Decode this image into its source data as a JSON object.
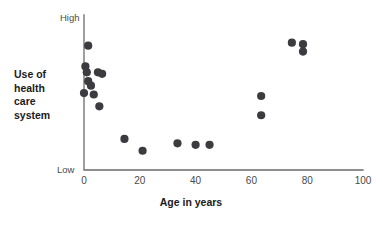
{
  "chart_data": {
    "type": "scatter",
    "title": "",
    "xlabel": "Age in years",
    "ylabel": "Use of health care system",
    "xlim": [
      0,
      100
    ],
    "ylim": [
      0,
      100
    ],
    "grid": false,
    "legend": null,
    "x_ticks": [
      "0",
      "20",
      "40",
      "60",
      "80",
      "100"
    ],
    "x_tick_values": [
      0,
      20,
      40,
      60,
      80,
      100
    ],
    "y_tick_labels": [
      "Low",
      "High"
    ],
    "y_tick_values": [
      0,
      100
    ],
    "marker_color": "#3c3c40",
    "marker_radius": 4.1,
    "axis_color": "#6a6a6a",
    "points": [
      {
        "x": 1.5,
        "y": 84
      },
      {
        "x": 0.5,
        "y": 70
      },
      {
        "x": 1.0,
        "y": 66
      },
      {
        "x": 5.0,
        "y": 66
      },
      {
        "x": 6.5,
        "y": 65
      },
      {
        "x": 1.5,
        "y": 60
      },
      {
        "x": 2.5,
        "y": 57
      },
      {
        "x": 0.0,
        "y": 52
      },
      {
        "x": 3.5,
        "y": 51
      },
      {
        "x": 5.5,
        "y": 43
      },
      {
        "x": 14.5,
        "y": 21
      },
      {
        "x": 21.0,
        "y": 13
      },
      {
        "x": 33.5,
        "y": 18
      },
      {
        "x": 40.0,
        "y": 17
      },
      {
        "x": 45.0,
        "y": 17
      },
      {
        "x": 63.5,
        "y": 50
      },
      {
        "x": 63.5,
        "y": 37
      },
      {
        "x": 74.5,
        "y": 86
      },
      {
        "x": 78.5,
        "y": 85
      },
      {
        "x": 78.5,
        "y": 80
      }
    ]
  },
  "labels": {
    "high": "High",
    "low": "Low",
    "y_axis_title": "Use of\nhealth\ncare\nsystem",
    "x_axis_title": "Age in years"
  }
}
